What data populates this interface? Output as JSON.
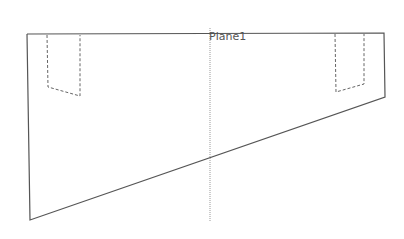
{
  "diagram": {
    "plane_label": "Plane1",
    "line_color": "#555555",
    "centerline_color": "#999999"
  }
}
